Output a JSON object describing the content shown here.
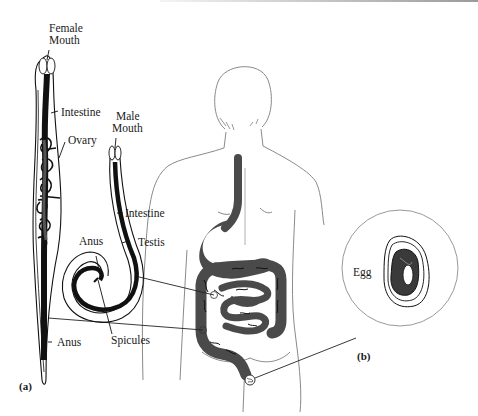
{
  "figure": {
    "panel_a": {
      "label": "(a)",
      "female_worm": {
        "labels": {
          "mouth_line1": "Female",
          "mouth_line2": "Mouth",
          "intestine": "Intestine",
          "ovary": "Ovary",
          "anus": "Anus"
        }
      },
      "male_worm": {
        "labels": {
          "mouth_line1": "Male",
          "mouth_line2": "Mouth",
          "intestine": "Intestine",
          "testis": "Testis",
          "anus": "Anus",
          "spicules": "Spicules"
        }
      }
    },
    "panel_b": {
      "label": "(b)",
      "egg_label": "Egg"
    },
    "colors": {
      "ink": "#1a1a1a",
      "gut_fill": "#4a4a4a",
      "outline": "#8a8a8a"
    }
  }
}
